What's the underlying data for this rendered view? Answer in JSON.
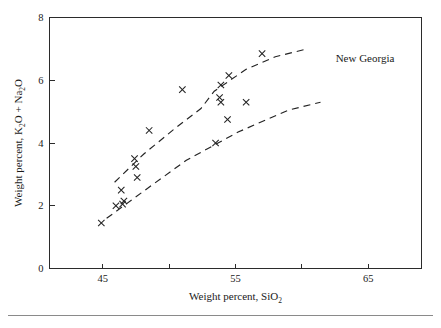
{
  "figure": {
    "annotation": "New Georgia",
    "footer_rule": true
  },
  "chart_data": {
    "type": "scatter",
    "title": "",
    "subtitle": "",
    "xlabel": "Weight percent, SiO2",
    "xlabel_parts": {
      "text": "Weight percent, SiO",
      "subscript": "2"
    },
    "ylabel": "Weight percent, K2O + Na2O",
    "ylabel_parts": {
      "pre": "Weight percent, K",
      "sub1": "2",
      "mid": "O + Na",
      "sub2": "2",
      "post": "O"
    },
    "xlim": [
      41,
      69
    ],
    "ylim": [
      0,
      8
    ],
    "xticks": [
      45,
      55,
      65
    ],
    "xticks_minor": [
      50,
      60
    ],
    "yticks": [
      0,
      2,
      4,
      6,
      8
    ],
    "xtick_labels": [
      "45",
      "55",
      "65"
    ],
    "ytick_labels": [
      "0",
      "2",
      "4",
      "6",
      "8"
    ],
    "grid": false,
    "legend": "none",
    "marker": "x",
    "marker_color": "#232323",
    "series": [
      {
        "name": "New Georgia samples",
        "points": [
          [
            44.9,
            1.45
          ],
          [
            46.0,
            2.0
          ],
          [
            46.4,
            2.5
          ],
          [
            46.5,
            2.05
          ],
          [
            46.6,
            2.15
          ],
          [
            47.4,
            3.5
          ],
          [
            47.5,
            3.25
          ],
          [
            47.6,
            2.9
          ],
          [
            48.5,
            4.4
          ],
          [
            51.0,
            5.7
          ],
          [
            53.5,
            4.0
          ],
          [
            53.8,
            5.45
          ],
          [
            53.9,
            5.3
          ],
          [
            53.9,
            5.85
          ],
          [
            54.5,
            6.15
          ],
          [
            54.4,
            4.75
          ],
          [
            55.8,
            5.3
          ],
          [
            57.0,
            6.85
          ]
        ]
      }
    ],
    "boundary_curves": [
      {
        "name": "upper-alkaline-boundary",
        "points": [
          [
            45.9,
            2.75
          ],
          [
            48.1,
            3.65
          ],
          [
            50.4,
            4.45
          ],
          [
            52.4,
            5.1
          ],
          [
            53.4,
            5.65
          ],
          [
            55.8,
            6.35
          ],
          [
            58.0,
            6.75
          ],
          [
            60.4,
            7.0
          ]
        ]
      },
      {
        "name": "lower-alkaline-boundary",
        "points": [
          [
            45.3,
            1.6
          ],
          [
            48.2,
            2.5
          ],
          [
            51.3,
            3.45
          ],
          [
            55.2,
            4.35
          ],
          [
            59.0,
            5.05
          ],
          [
            61.4,
            5.3
          ]
        ]
      }
    ]
  }
}
